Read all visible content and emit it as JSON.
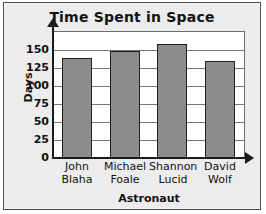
{
  "chart_data": {
    "type": "bar",
    "title": "Time Spent in Space",
    "xlabel": "Astronaut",
    "ylabel": "Days",
    "categories": [
      "John Blaha",
      "Michael Foale",
      "Shannon Lucid",
      "David Wolf"
    ],
    "category_lines": [
      [
        "John",
        "Blaha"
      ],
      [
        "Michael",
        "Foale"
      ],
      [
        "Shannon",
        "Lucid"
      ],
      [
        "David",
        "Wolf"
      ]
    ],
    "values": [
      139,
      149,
      158,
      135
    ],
    "ylim": [
      0,
      175
    ],
    "yticks": [
      0,
      25,
      50,
      75,
      100,
      125,
      150
    ],
    "ytick_labels": [
      "0",
      "25",
      "50",
      "75",
      "100",
      "125",
      "150"
    ],
    "grid": true,
    "legend": false,
    "bar_color": "#8c8c8c",
    "bar_border_color": "#1f1f1f",
    "axis_color": "#1b1b1b",
    "gridline_color": "#777777",
    "plot_background": "#ffffff",
    "figure_background": "#ececed",
    "frame_border_color": "#4c4c4c"
  }
}
